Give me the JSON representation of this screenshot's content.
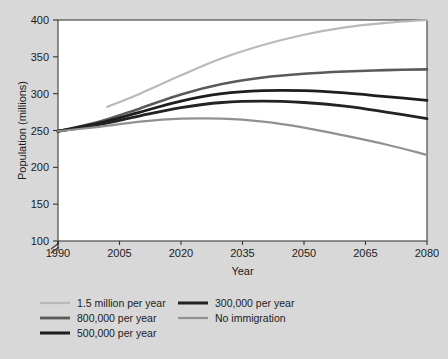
{
  "chart_data": {
    "type": "line",
    "title": "",
    "xlabel": "Year",
    "ylabel": "Population (millions)",
    "xlim": [
      1990,
      2080
    ],
    "ylim": [
      100,
      400
    ],
    "y_axis_break": true,
    "grid": false,
    "legend_position": "bottom",
    "xticks": [
      "1990",
      "2005",
      "2020",
      "2035",
      "2050",
      "2065",
      "2080"
    ],
    "yticks": [
      "100",
      "150",
      "200",
      "250",
      "300",
      "350",
      "400"
    ],
    "x": [
      1990,
      2000,
      2010,
      2020,
      2030,
      2040,
      2050,
      2060,
      2070,
      2080
    ],
    "series": [
      {
        "name": "1.5 million per year",
        "color": "#b9b9b9",
        "width": 2.2,
        "start_year": 2002,
        "x": [
          2002,
          2010,
          2020,
          2030,
          2040,
          2050,
          2060,
          2070,
          2080
        ],
        "values": [
          282,
          300,
          325,
          348,
          366,
          380,
          390,
          396,
          400
        ]
      },
      {
        "name": "800,000 per year",
        "color": "#5a5a5a",
        "width": 2.6,
        "x": [
          1990,
          2000,
          2010,
          2020,
          2030,
          2040,
          2050,
          2060,
          2070,
          2080
        ],
        "values": [
          249,
          262,
          280,
          299,
          313,
          322,
          327,
          330,
          332,
          333
        ]
      },
      {
        "name": "500,000 per year",
        "color": "#1d1d1d",
        "width": 2.8,
        "x": [
          1990,
          2000,
          2010,
          2020,
          2030,
          2040,
          2050,
          2060,
          2070,
          2080
        ],
        "values": [
          249,
          260,
          275,
          290,
          300,
          304,
          304,
          301,
          296,
          291
        ]
      },
      {
        "name": "300,000 per year",
        "color": "#232323",
        "width": 2.8,
        "x": [
          1990,
          2000,
          2010,
          2020,
          2030,
          2040,
          2050,
          2060,
          2070,
          2080
        ],
        "values": [
          249,
          258,
          270,
          281,
          288,
          290,
          288,
          283,
          275,
          266
        ]
      },
      {
        "name": "No immigration",
        "color": "#919191",
        "width": 2.2,
        "x": [
          1990,
          2000,
          2010,
          2020,
          2030,
          2040,
          2050,
          2060,
          2070,
          2080
        ],
        "values": [
          249,
          255,
          262,
          266,
          266,
          262,
          254,
          243,
          231,
          217
        ]
      }
    ],
    "legend_entries": [
      {
        "label": "1.5 million per year",
        "color": "#b9b9b9",
        "width": 2.2,
        "col": 0,
        "row": 0
      },
      {
        "label": "800,000 per year",
        "color": "#5a5a5a",
        "width": 2.8,
        "col": 0,
        "row": 1
      },
      {
        "label": "500,000 per year",
        "color": "#1d1d1d",
        "width": 3.0,
        "col": 0,
        "row": 2
      },
      {
        "label": "300,000 per year",
        "color": "#232323",
        "width": 3.0,
        "col": 1,
        "row": 0
      },
      {
        "label": "No immigration",
        "color": "#919191",
        "width": 2.2,
        "col": 1,
        "row": 1
      }
    ]
  },
  "colors": {
    "background": "#d8d8d8",
    "plot_background": "#ffffff",
    "axis": "#333333",
    "text": "#1c1c1c"
  }
}
